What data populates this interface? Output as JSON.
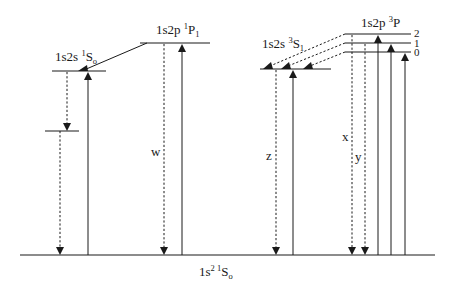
{
  "diagram": {
    "ground_state": {
      "config": "1s",
      "sup": "2 1",
      "term": "S",
      "sub": "o"
    },
    "levels": [
      {
        "id": "1s2s-1S0",
        "config": "1s2s ",
        "sup": "1",
        "term": "S",
        "sub": "o"
      },
      {
        "id": "1s2p-1P1",
        "config": "1s2p ",
        "sup": "1",
        "term": "P",
        "sub": "1"
      },
      {
        "id": "1s2s-3S1",
        "config": "1s2s ",
        "sup": "3",
        "term": "S",
        "sub": "1"
      },
      {
        "id": "1s2p-3P",
        "config": "1s2p ",
        "sup": "3",
        "term": "P",
        "sub": ""
      }
    ],
    "j_labels": [
      "2",
      "1",
      "0"
    ],
    "transition_labels": {
      "w": "w",
      "x": "x",
      "y": "y",
      "z": "z"
    }
  }
}
